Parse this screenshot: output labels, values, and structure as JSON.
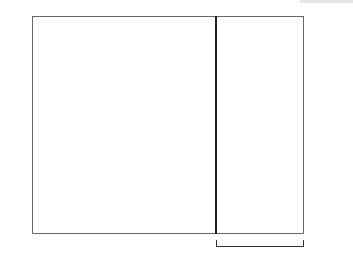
{
  "chart_data": {
    "type": "table",
    "columns": 31,
    "rows": 25,
    "row_order": "top-to-bottom, row 25 first",
    "legend": {
      "1": "dark (contrast color)",
      "0": "light (main color)"
    },
    "colors": {
      "dark": "#555555",
      "light": "#e6e6e6"
    },
    "grid": [
      "1010101010101010101010101010101",
      "0101010101010101010101010101010",
      "0000000000000000000000000000000",
      "0000000000000000000000000000000",
      "0011000110001100011000110001100",
      "0111101111011110111101111011110",
      "0111111111011111111101111111110",
      "0111111111011111111101111111110",
      "0011111110001111111000111111100",
      "1001111100100111110010011111001",
      "1010111010101011101010101110101",
      "0101010101010101010101010101010",
      "1010101010101010101010101010101",
      "0101010101010101010101010101010",
      "1010111010101011101010101110101",
      "1001111100100111110010011111001",
      "0011111110001111111000111111100",
      "0111111111011111111101111111110",
      "0111111111011111111101111111110",
      "0111101111011110111101111011110",
      "0011000110001100011000110001100",
      "0000000000000000000000000000000",
      "0000000000000000000000000000000",
      "0101010101010101010101010101010",
      "1010101010101010101010101010101"
    ],
    "left_row_labels": [
      "24",
      "22",
      "20",
      "18",
      "16",
      "14",
      "12",
      "10",
      "8",
      "6",
      "4",
      "2"
    ],
    "right_row_labels": [
      "25",
      "23",
      "21",
      "19",
      "17",
      "15",
      "13",
      "11",
      "9",
      "7",
      "5",
      "3",
      "1"
    ],
    "repeat": {
      "label": "10-st repeat",
      "start_col": 22,
      "end_col": 31
    }
  },
  "labels": {
    "left": [
      "24",
      "22",
      "20",
      "18",
      "16",
      "14",
      "12",
      "10",
      "8",
      "6",
      "4",
      "2"
    ],
    "right": [
      "25",
      "23",
      "21",
      "19",
      "17",
      "15",
      "13",
      "11",
      "9",
      "7",
      "5",
      "3",
      "1"
    ],
    "repeat": "10-st repeat"
  }
}
